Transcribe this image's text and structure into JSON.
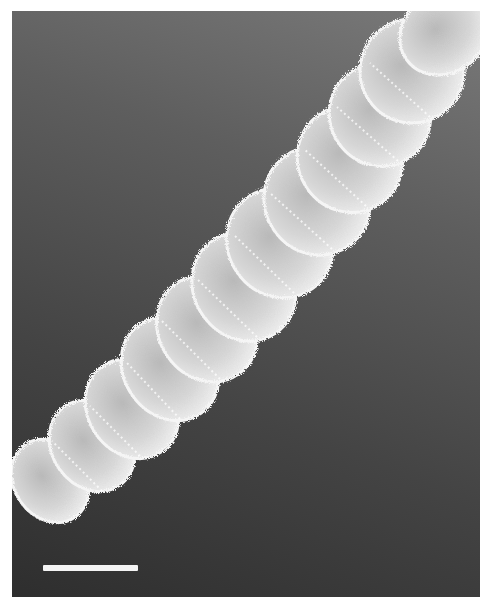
{
  "figure": {
    "type": "scanning electron micrograph",
    "segments": 11,
    "scale_bar": {
      "visible": true,
      "label": ""
    },
    "colors": {
      "background_top": "#7a7a7a",
      "background_bottom": "#2e2e2e",
      "specimen": "#d8d8d8",
      "scale_bar": "#f4f4f4"
    }
  }
}
